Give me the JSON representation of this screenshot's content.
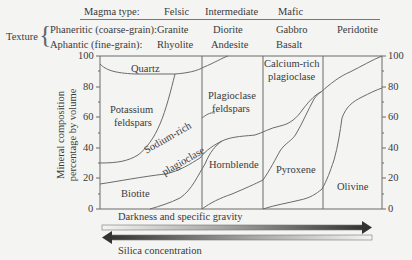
{
  "header": {
    "magma_type_label": "Magma type:",
    "magma_types": [
      "Felsic",
      "Intermediate",
      "Mafic"
    ],
    "texture_label": "Texture",
    "phaneritic_label": "Phaneritic (coarse-grain):",
    "aphantic_label": "Aphantic (fine-grain):",
    "phaneritic_rocks": [
      "Granite",
      "Diorite",
      "Gabbro",
      "Peridotite"
    ],
    "aphantic_rocks": [
      "Rhyolite",
      "Andesite",
      "Basalt"
    ]
  },
  "axis": {
    "ylabel_line1": "Mineral composition",
    "ylabel_line2": "percentage by volume",
    "ticks": [
      "100",
      "80",
      "60",
      "40",
      "20",
      "0"
    ]
  },
  "regions": {
    "quartz": "Quartz",
    "potassium_1": "Potassium",
    "potassium_2": "feldspars",
    "sodium_1": "Sodium-rich",
    "sodium_2": "plagioclase",
    "biotite": "Biotite",
    "plagioclase_1": "Plagioclase",
    "plagioclase_2": "feldspars",
    "hornblende": "Hornblende",
    "calcium_1": "Calcium-rich",
    "calcium_2": "plagioclase",
    "pyroxene": "Pyroxene",
    "olivine": "Olivine"
  },
  "arrows": {
    "darkness_label": "Darkness and specific gravity",
    "silica_label": "Silica concentration"
  },
  "colors": {
    "line": "#6b6b6b",
    "arrow_dark": "#3a3a3a",
    "arrow_light": "#f2f2f2"
  }
}
